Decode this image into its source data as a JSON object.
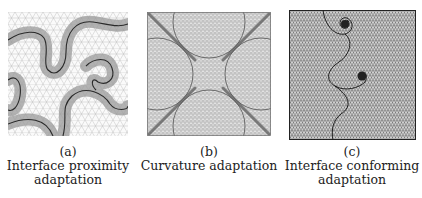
{
  "figure": {
    "panels": [
      {
        "id": "a",
        "label": "(a)",
        "caption_line1": "Interface proximity",
        "caption_line2": "adaptation"
      },
      {
        "id": "b",
        "label": "(b)",
        "caption_line1": "Curvature adaptation",
        "caption_line2": ""
      },
      {
        "id": "c",
        "label": "(c)",
        "caption_line1": "Interface conforming",
        "caption_line2": "adaptation"
      }
    ]
  },
  "colors": {
    "mesh_light": "#b8b8b8",
    "mesh_dark": "#555555",
    "interface": "#222222",
    "background": "#ffffff"
  }
}
